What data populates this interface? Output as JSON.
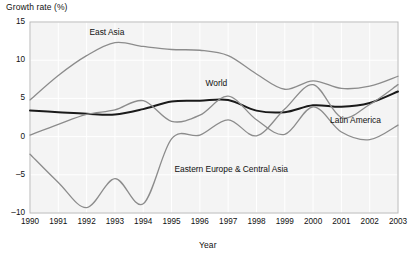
{
  "chart_data": {
    "type": "line",
    "title": "",
    "ylabel": "Growth rate (%)",
    "xlabel": "Year",
    "ylim": [
      -10,
      15
    ],
    "xlim": [
      1990,
      2003
    ],
    "y_ticks": [
      "15",
      "10",
      "5",
      "0",
      "-5",
      "-10"
    ],
    "y_tick_values": [
      15,
      10,
      5,
      0,
      -5,
      -10
    ],
    "grid": true,
    "legend_position": "inline-labels",
    "x": [
      1990,
      1991,
      1992,
      1993,
      1994,
      1995,
      1996,
      1997,
      1998,
      1999,
      2000,
      2001,
      2002,
      2003
    ],
    "categories": [
      "1990",
      "1991",
      "1992",
      "1993",
      "1994",
      "1995",
      "1996",
      "1997",
      "1998",
      "1999",
      "2000",
      "2001",
      "2002",
      "2003"
    ],
    "series": [
      {
        "name": "East Asia",
        "color": "#8c8c8c",
        "width": 1.3,
        "label_x": 1992.1,
        "label_y": 13.6,
        "values": [
          4.8,
          8.0,
          10.6,
          12.3,
          11.8,
          11.4,
          11.3,
          10.6,
          8.2,
          6.2,
          7.3,
          6.3,
          6.6,
          7.9
        ]
      },
      {
        "name": "World",
        "color": "#1a1a1a",
        "width": 2.0,
        "label_x": 1996.2,
        "label_y": 6.9,
        "values": [
          3.4,
          3.2,
          3.0,
          2.9,
          3.6,
          4.6,
          4.7,
          4.8,
          3.4,
          3.2,
          4.1,
          3.9,
          4.4,
          5.9
        ]
      },
      {
        "name": "Latin America",
        "color": "#8c8c8c",
        "width": 1.3,
        "label_x": 2000.6,
        "label_y": 2.0,
        "values": [
          0.2,
          1.6,
          2.9,
          3.5,
          4.7,
          2.0,
          2.8,
          5.3,
          2.2,
          0.3,
          3.9,
          0.6,
          -0.4,
          1.5
        ]
      },
      {
        "name": "Eastern Europe & Central Asia",
        "color": "#8c8c8c",
        "width": 1.3,
        "label_x": 1995.1,
        "label_y": -4.3,
        "values": [
          -2.3,
          -6.0,
          -9.3,
          -5.5,
          -8.8,
          -0.3,
          0.2,
          2.2,
          0.1,
          3.6,
          6.8,
          2.5,
          4.2,
          6.8
        ]
      }
    ]
  },
  "plot": {
    "left": 30,
    "right": 398,
    "top": 22,
    "bottom": 213,
    "bg": "#f4f4f4",
    "grid_color": "#ffffff",
    "border_color": "#b9b9b9"
  }
}
